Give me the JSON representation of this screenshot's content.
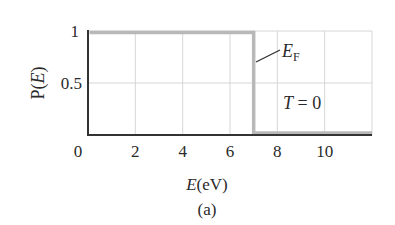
{
  "chart_data": {
    "type": "line",
    "title": "",
    "caption": "(a)",
    "xlabel": "E(eV)",
    "xlabel_var": "E",
    "xlabel_unit": "(eV)",
    "ylabel": "P(E)",
    "ylabel_var": "E",
    "xlim": [
      0,
      12
    ],
    "ylim": [
      0,
      1
    ],
    "xticks": [
      0,
      2,
      4,
      6,
      8,
      10
    ],
    "xtick_labels": [
      "0",
      "2",
      "4",
      "6",
      "8",
      "10"
    ],
    "yticks": [
      0.5,
      1
    ],
    "ytick_labels": [
      "0.5",
      "1"
    ],
    "grid": true,
    "series": [
      {
        "name": "P(E) at T=0",
        "x": [
          0,
          7,
          7,
          12
        ],
        "y": [
          1,
          1,
          0,
          0
        ],
        "color": "#b8b8b8"
      }
    ],
    "annotations": [
      {
        "text": "E_F",
        "x": 7,
        "y": 0.85,
        "label_main": "E",
        "label_sub": "F"
      },
      {
        "text": "T = 0",
        "x": 9,
        "y": 0.3
      }
    ],
    "fermi_energy": 7
  }
}
